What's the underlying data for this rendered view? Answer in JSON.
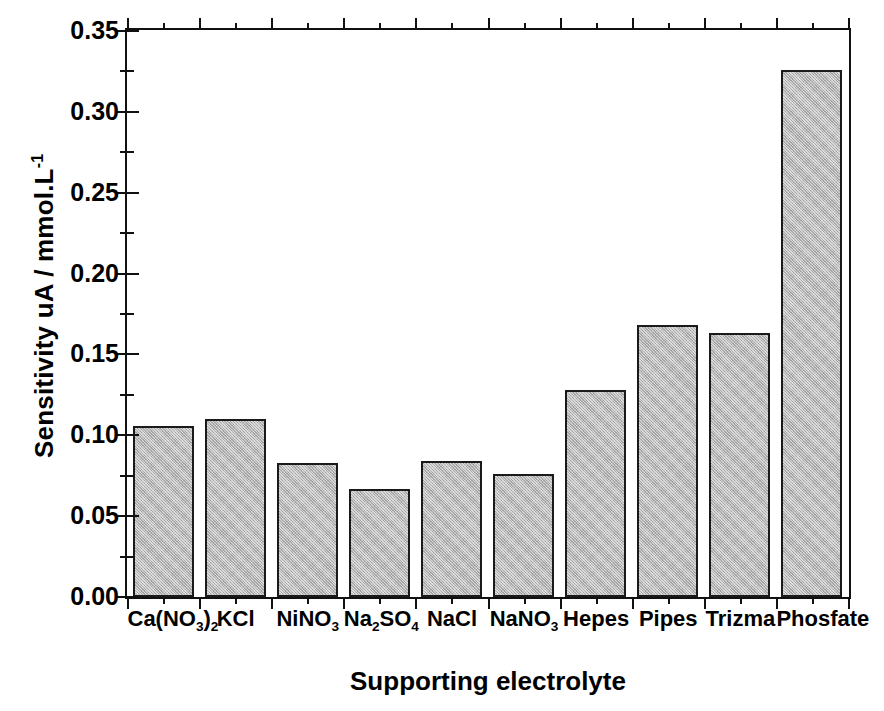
{
  "chart_data": {
    "type": "bar",
    "title": "",
    "xlabel": "Supporting electrolyte",
    "ylabel": "Sensitivity uA / mmol.L-1",
    "ylabel_parts": {
      "main": "Sensitivity uA / mmol.L",
      "sup": "-1"
    },
    "categories": [
      "Ca(NO3)2",
      "KCl",
      "NiNO3",
      "Na2SO4",
      "NaCl",
      "NaNO3",
      "Hepes",
      "Pipes",
      "Trizma",
      "Phosfate"
    ],
    "category_labels_html": [
      "Ca(NO<sub>3</sub>)<sub>2</sub>",
      "KCl",
      "NiNO<sub>3</sub>",
      "Na<sub>2</sub>SO<sub>4</sub>",
      "NaCl",
      "NaNO<sub>3</sub>",
      "Hepes",
      "Pipes",
      "Trizma",
      "Phosfate"
    ],
    "values": [
      0.106,
      0.11,
      0.083,
      0.067,
      0.084,
      0.076,
      0.128,
      0.168,
      0.163,
      0.326
    ],
    "ylim": [
      0.0,
      0.35
    ],
    "ytick_labels": [
      "0.00",
      "0.05",
      "0.10",
      "0.15",
      "0.20",
      "0.25",
      "0.30",
      "0.35"
    ],
    "ytick_values": [
      0.0,
      0.05,
      0.1,
      0.15,
      0.2,
      0.25,
      0.3,
      0.35
    ],
    "yminor_values": [
      0.025,
      0.075,
      0.125,
      0.175,
      0.225,
      0.275,
      0.325
    ],
    "grid": false,
    "legend": "none",
    "bar_color": "#b5b5b5",
    "bar_edge_color": "#1a1a1a",
    "axis_color": "#111111",
    "background": "#ffffff"
  }
}
